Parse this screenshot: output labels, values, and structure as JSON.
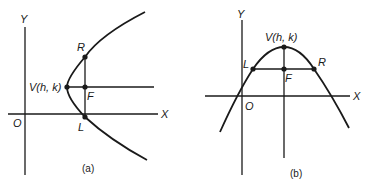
{
  "figure": {
    "panel_a": {
      "caption": "(a)",
      "axis_x_label": "X",
      "axis_y_label": "Y",
      "origin_label": "O",
      "vertex_label": "V(h, k)",
      "focus_label": "F",
      "latus_top_label": "R",
      "latus_bottom_label": "L",
      "orientation": "opens right"
    },
    "panel_b": {
      "caption": "(b)",
      "axis_x_label": "X",
      "axis_y_label": "Y",
      "origin_label": "O",
      "vertex_label": "V(h, k)",
      "focus_label": "F",
      "latus_left_label": "L",
      "latus_right_label": "R",
      "orientation": "opens down"
    },
    "colors": {
      "ink": "#1a1a1a",
      "background": "#ffffff"
    }
  }
}
